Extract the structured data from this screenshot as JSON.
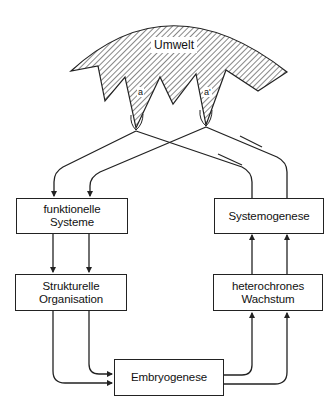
{
  "diagram": {
    "environment": {
      "label": "Umwelt",
      "fill_pattern": "diagonal-hatch"
    },
    "interfaces": [
      {
        "id": "a",
        "label": "a"
      },
      {
        "id": "a_prime",
        "label": "a'"
      }
    ],
    "nodes": {
      "funktionelle_systeme": {
        "line1": "funktionelle",
        "line2": "Systeme"
      },
      "strukturelle_organisation": {
        "line1": "Strukturelle",
        "line2": "Organisation"
      },
      "embryogenese": {
        "line1": "Embryogenese"
      },
      "heterochrones_wachstum": {
        "line1": "heterochrones",
        "line2": "Wachstum"
      },
      "systemogenese": {
        "line1": "Systemogenese"
      }
    },
    "edges": [
      {
        "from": "a",
        "to": "funktionelle_systeme"
      },
      {
        "from": "a_prime",
        "to": "funktionelle_systeme"
      },
      {
        "from": "funktionelle_systeme",
        "to": "strukturelle_organisation",
        "count": 2
      },
      {
        "from": "strukturelle_organisation",
        "to": "embryogenese",
        "count": 2
      },
      {
        "from": "embryogenese",
        "to": "heterochrones_wachstum",
        "count": 2
      },
      {
        "from": "heterochrones_wachstum",
        "to": "systemogenese",
        "count": 2
      },
      {
        "from": "systemogenese",
        "to": "a"
      },
      {
        "from": "systemogenese",
        "to": "a_prime"
      }
    ],
    "colors": {
      "line": "#222222",
      "background": "#ffffff"
    }
  }
}
